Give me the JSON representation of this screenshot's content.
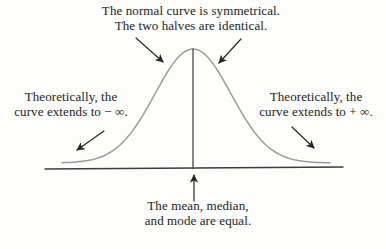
{
  "figure": {
    "colors": {
      "background": "#fdfdfc",
      "curve": "#9b9b9b",
      "axis": "#3d3d3d",
      "center_line": "#4a4a4a",
      "arrow": "#262626",
      "text": "#1c1c1c"
    },
    "labels": {
      "symmetry": {
        "line1": "The normal curve is symmetrical.",
        "line2": "The two halves are identical."
      },
      "left_tail": {
        "line1": "Theoretically, the",
        "line2": "curve extends to − ∞."
      },
      "right_tail": {
        "line1": "Theoretically, the",
        "line2": "curve extends to + ∞."
      },
      "center": {
        "line1": "The mean, median,",
        "line2": "and mode are equal."
      }
    },
    "geometry": {
      "canvas": {
        "width": 386,
        "height": 249
      },
      "curve": {
        "mu": 193,
        "sigma": 38,
        "amplitude": 114,
        "base_y": 163,
        "x_start": 62,
        "x_end": 330
      },
      "axis": {
        "x1": 45,
        "y1": 169,
        "x2": 343,
        "y2": 167
      },
      "center_line": {
        "x": 193,
        "y1": 49,
        "y2": 168.5
      },
      "arrows": [
        {
          "name": "symmetry-left-arrow",
          "x1": 136,
          "y1": 38,
          "x2": 163,
          "y2": 62
        },
        {
          "name": "symmetry-right-arrow",
          "x1": 241,
          "y1": 39,
          "x2": 219,
          "y2": 63
        },
        {
          "name": "left-tail-arrow",
          "x1": 104,
          "y1": 131,
          "x2": 77,
          "y2": 150
        },
        {
          "name": "right-tail-arrow",
          "x1": 292,
          "y1": 127,
          "x2": 314,
          "y2": 148
        },
        {
          "name": "mean-arrow",
          "x1": 194,
          "y1": 201,
          "x2": 194,
          "y2": 175
        }
      ]
    }
  }
}
